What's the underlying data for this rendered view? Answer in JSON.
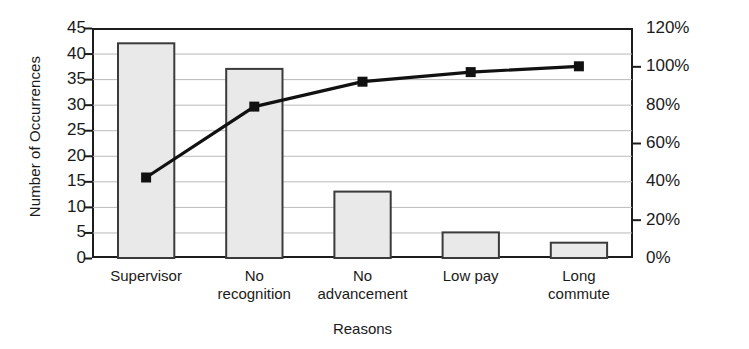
{
  "chart_data": {
    "type": "bar",
    "title": "",
    "subtitle": "",
    "xlabel": "Reasons",
    "ylabel": "Number of Occurrences",
    "y2label": "",
    "categories": [
      "Supervisor",
      "No recognition",
      "No advancement",
      "Low pay",
      "Long commute"
    ],
    "category_lines": [
      [
        "Supervisor"
      ],
      [
        "No",
        "recognition"
      ],
      [
        "No",
        "advancement"
      ],
      [
        "Low pay"
      ],
      [
        "Long",
        "commute"
      ]
    ],
    "series": [
      {
        "name": "Number of Occurrences",
        "type": "bar",
        "axis": "left",
        "values": [
          42,
          37,
          13,
          5,
          3
        ]
      },
      {
        "name": "Cumulative Percentage",
        "type": "line",
        "axis": "right",
        "values": [
          42,
          79,
          92,
          97,
          100
        ],
        "marker": "square",
        "marker_values_left_axis": [
          16,
          30,
          35,
          37,
          38
        ]
      }
    ],
    "ylim": [
      0,
      45
    ],
    "yticks": [
      0,
      5,
      10,
      15,
      20,
      25,
      30,
      35,
      40,
      45
    ],
    "ytick_labels": [
      "0",
      "5",
      "10",
      "15",
      "20",
      "25",
      "30",
      "35",
      "40",
      "45"
    ],
    "y2lim": [
      0,
      120
    ],
    "y2ticks": [
      0,
      20,
      40,
      60,
      80,
      100,
      120
    ],
    "y2tick_labels": [
      "0%",
      "20%",
      "40%",
      "60%",
      "80%",
      "100%",
      "120%"
    ],
    "grid": true,
    "grid_axis": "y",
    "legend": "none",
    "colors": {
      "bar_fill": "#e9e9e9",
      "bar_edge": "#3b3b3b",
      "line": "#111111",
      "marker": "#111111",
      "grid": "#b9b9b9",
      "axis": "#1c1c1c",
      "text": "#1a1a1a",
      "background": "#ffffff"
    }
  }
}
